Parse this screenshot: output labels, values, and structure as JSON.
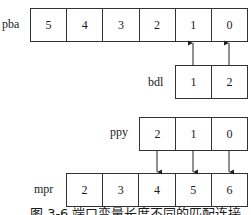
{
  "diagram": {
    "pba": {
      "label": "pba",
      "cells": [
        "5",
        "4",
        "3",
        "2",
        "1",
        "0"
      ]
    },
    "bdl": {
      "label": "bdl",
      "cells": [
        "1",
        "2"
      ]
    },
    "ppy": {
      "label": "ppy",
      "cells": [
        "2",
        "1",
        "0"
      ]
    },
    "mpr": {
      "label": "mpr",
      "cells": [
        "2",
        "3",
        "4",
        "5",
        "6"
      ]
    },
    "connections": [
      {
        "from": "bdl[1]",
        "to": "pba[1]"
      },
      {
        "from": "bdl[2]",
        "to": "pba[0]"
      },
      {
        "from": "ppy[2]",
        "to": "mpr[4]"
      },
      {
        "from": "ppy[1]",
        "to": "mpr[5]"
      },
      {
        "from": "ppy[0]",
        "to": "mpr[6]"
      }
    ],
    "caption": "图 3-6   端口变量长度不同的匹配连接"
  }
}
